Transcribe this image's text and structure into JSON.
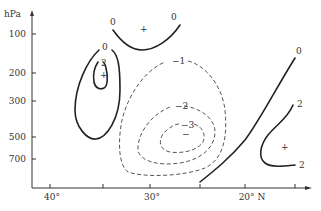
{
  "figure": {
    "y_axis": {
      "unit_label": "hPa",
      "ticks": [
        {
          "label": "100",
          "y": 34
        },
        {
          "label": "200",
          "y": 73
        },
        {
          "label": "300",
          "y": 101
        },
        {
          "label": "500",
          "y": 137
        },
        {
          "label": "700",
          "y": 159
        }
      ]
    },
    "x_axis": {
      "ticks": [
        {
          "label": "40°",
          "x": 50
        },
        {
          "label": "",
          "x": 103
        },
        {
          "label": "30°",
          "x": 150
        },
        {
          "label": "",
          "x": 200
        },
        {
          "label": "20° N",
          "x": 245
        },
        {
          "label": "",
          "x": 295
        }
      ]
    },
    "contours": {
      "top_zero_left_label": "0",
      "top_zero_right_label": "0",
      "top_center_marker": "+",
      "left_outer_label": "0",
      "left_inner_label": "2",
      "left_center_marker": "+",
      "neg1_label": "−1",
      "neg2_label": "−2",
      "neg3_label": "−3",
      "neg_center_marker": "−",
      "right_zero_label": "0",
      "right_upper_label": "2",
      "right_lower_label": "2",
      "right_center_marker": "+"
    },
    "colors": {
      "line": "#222222",
      "text": "#333333",
      "background": "#ffffff"
    }
  }
}
